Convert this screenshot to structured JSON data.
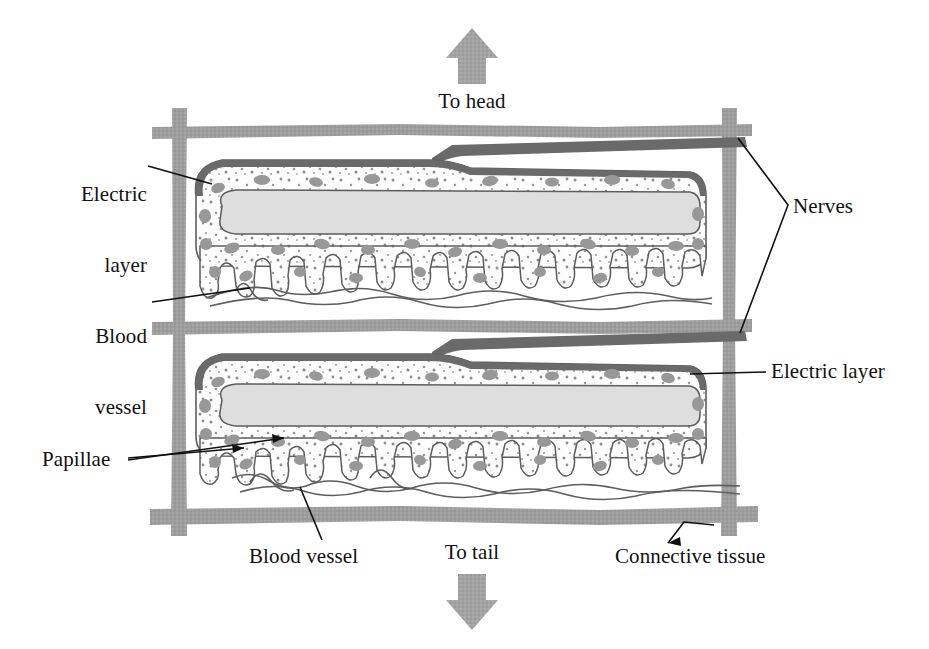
{
  "figure": {
    "background_color": "#ffffff"
  },
  "colors": {
    "connective_tissue": "#9d9d9d",
    "nerve": "#6a6a6a",
    "electric_core": "#dedede",
    "electric_layer_fill": "#fdfdfd",
    "blob": "#9a9a9a",
    "outline": "#5d5d5d",
    "leader_line": "#101010",
    "arrow": "#a3a3a3",
    "text": "#111111"
  },
  "labels": {
    "electric_layer_left": {
      "line1": "Electric",
      "line2": "layer",
      "x": 47,
      "y": 136
    },
    "blood_vessel_left": {
      "line1": "Blood",
      "line2": "vessel",
      "x": 62,
      "y": 279
    },
    "papillae": {
      "text": "Papillae",
      "x": 42,
      "y": 451
    },
    "nerves": {
      "text": "Nerves",
      "x": 793,
      "y": 198
    },
    "electric_layer_right": {
      "text": "Electric layer",
      "x": 771,
      "y": 357
    },
    "connective_tissue": {
      "text": "Connective tissue",
      "x": 615,
      "y": 546
    },
    "blood_vessel_bottom": {
      "text": "Blood vessel",
      "x": 249,
      "y": 546
    },
    "to_head": {
      "text": "To head",
      "x": 419,
      "y": 93
    },
    "to_tail": {
      "text": "To tail",
      "x": 429,
      "y": 544
    }
  },
  "arrows": {
    "to_head": {
      "direction": "up",
      "x": 450,
      "y": 30,
      "width": 44,
      "height": 52
    },
    "to_tail": {
      "direction": "down",
      "x": 450,
      "y": 575,
      "width": 44,
      "height": 52
    }
  },
  "structures": {
    "connective_tissue_grid": {
      "name": "connective tissue",
      "horizontal_bars": 3,
      "vertical_bars": 2,
      "bar_y": [
        129,
        324,
        512
      ],
      "bar_x": [
        176,
        727
      ]
    },
    "electric_organs": [
      {
        "name": "upper electric organ",
        "top": 142,
        "bottom": 310
      },
      {
        "name": "lower electric organ",
        "top": 337,
        "bottom": 500
      }
    ],
    "nerve_count": 2,
    "papillae_note": "finger-like projections on the ventral surface of each electric layer",
    "blood_vessel_note": "wavy vessels running beneath the papillae of each organ"
  }
}
